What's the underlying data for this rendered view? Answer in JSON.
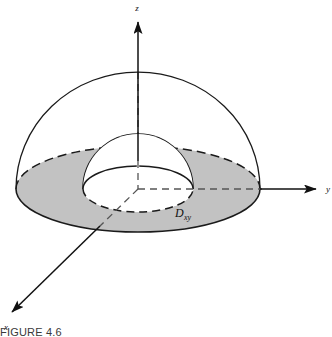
{
  "figure": {
    "caption": "FIGURE  4.6",
    "axes": {
      "z_label": "z",
      "y_label": "y",
      "x_label": "x"
    },
    "region_label": {
      "base": "D",
      "subscript": "xy"
    },
    "colors": {
      "shaded_region_fill": "#c2c2c2",
      "outline": "#1a1a1a",
      "background": "#ffffff",
      "caption_text": "#3a3a3a"
    },
    "geometry": {
      "origin_x": 138,
      "origin_y": 189,
      "outer_disc_rx": 122,
      "outer_disc_ry": 43,
      "inner_hole_rx": 55,
      "inner_hole_ry": 23,
      "outer_dome_apex_y": 72,
      "inner_dome_apex_y": 134,
      "z_axis_tip_y": 18,
      "y_axis_tip_x": 312,
      "x_axis_tip_x": 10,
      "x_axis_tip_y": 314
    }
  }
}
